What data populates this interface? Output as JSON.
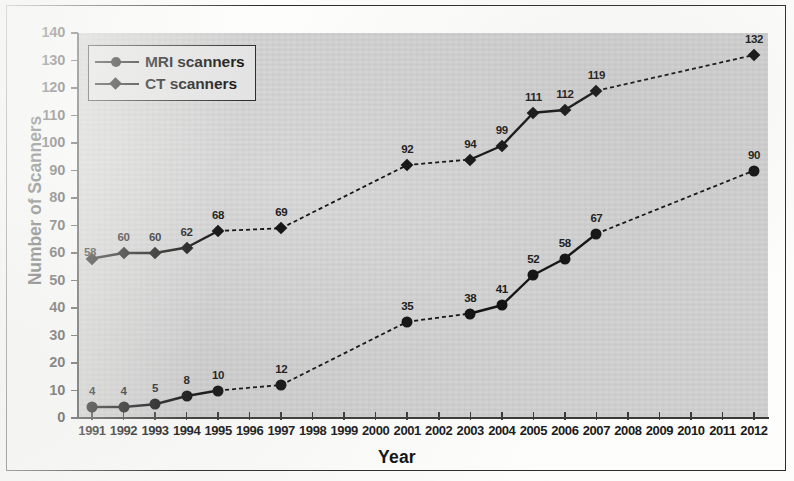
{
  "figure": {
    "background_color": "#d2d2d2",
    "frame_color": "#2c2c2c",
    "series_color": "#131313"
  },
  "axes": {
    "y_title": "Number of Scanners",
    "x_title": "Year"
  },
  "legend": {
    "items": [
      {
        "label": "MRI scanners",
        "marker": "circle-marker-icon"
      },
      {
        "label": "CT scanners",
        "marker": "diamond-marker-icon"
      }
    ]
  },
  "chart_data": {
    "type": "line",
    "title": "",
    "xlabel": "Year",
    "ylabel": "Number of Scanners",
    "ylim": [
      0,
      140
    ],
    "ytick_step": 10,
    "yticks": [
      0,
      10,
      20,
      30,
      40,
      50,
      60,
      70,
      80,
      90,
      100,
      110,
      120,
      130,
      140
    ],
    "categories": [
      "1991",
      "1992",
      "1993",
      "1994",
      "1995",
      "1996",
      "1997",
      "1998",
      "1999",
      "2000",
      "2001",
      "2002",
      "2003",
      "2004",
      "2005",
      "2006",
      "2007",
      "2008",
      "2009",
      "2010",
      "2011",
      "2012"
    ],
    "grid": false,
    "legend_position": "top-left",
    "series": [
      {
        "name": "MRI scanners",
        "marker": "circle",
        "values": [
          4,
          4,
          5,
          8,
          10,
          null,
          12,
          null,
          null,
          null,
          35,
          null,
          38,
          41,
          52,
          58,
          67,
          null,
          null,
          null,
          null,
          90
        ],
        "labels": {
          "1991": "4",
          "1992": "4",
          "1993": "5",
          "1994": "8",
          "1995": "10",
          "1997": "12",
          "2001": "35",
          "2003": "38",
          "2004": "41",
          "2005": "52",
          "2006": "58",
          "2007": "67",
          "2012": "90"
        }
      },
      {
        "name": "CT scanners",
        "marker": "diamond",
        "values": [
          58,
          60,
          60,
          62,
          68,
          null,
          69,
          null,
          null,
          null,
          92,
          null,
          94,
          99,
          111,
          112,
          119,
          null,
          null,
          null,
          null,
          132
        ],
        "labels": {
          "1991": "58",
          "1992": "60",
          "1993": "60",
          "1994": "62",
          "1995": "68",
          "1997": "69",
          "2001": "92",
          "2003": "94",
          "2004": "99",
          "2005": "111",
          "2006": "112",
          "2007": "119",
          "2012": "132"
        }
      }
    ]
  }
}
